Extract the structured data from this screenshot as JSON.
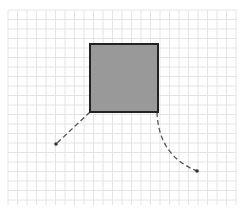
{
  "canvas": {
    "width": 244,
    "height": 213,
    "background": "#ffffff"
  },
  "grid": {
    "x0": 8,
    "y0": 10,
    "x1": 236,
    "y1": 205,
    "step": 9.5,
    "color": "#e4e4e4"
  },
  "shape": {
    "type": "square",
    "x": 90,
    "y": 44,
    "w": 68,
    "h": 68,
    "fill": "#999999",
    "stroke": "#222222"
  },
  "arrows": [
    {
      "name": "arrow-left",
      "path": "M90,112 L56,144",
      "tip": [
        56,
        144
      ]
    },
    {
      "name": "arrow-right",
      "path": "M157,112 C158,140 170,160 197,171",
      "tip": [
        197,
        171
      ]
    }
  ]
}
